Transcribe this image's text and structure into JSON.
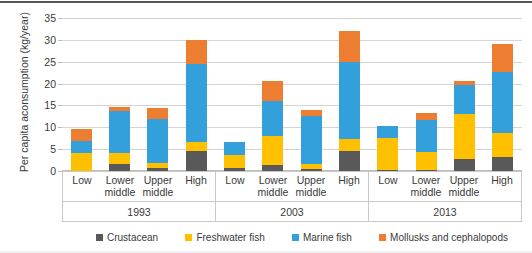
{
  "chart_data": {
    "type": "bar",
    "subtype": "stacked-bar-grouped",
    "title": "",
    "xlabel": "",
    "ylabel": "Per capita aconsumption (kg/year)",
    "ylim": [
      0,
      35
    ],
    "yticks": [
      0,
      5,
      10,
      15,
      20,
      25,
      30,
      35
    ],
    "grid": true,
    "legend_position": "bottom",
    "group_labels": [
      "1993",
      "2003",
      "2013"
    ],
    "categories": [
      "Low",
      "Lower middle",
      "Upper middle",
      "High"
    ],
    "series": [
      {
        "name": "Crustacean",
        "color": "#595959",
        "values_by_group": {
          "1993": [
            0.0,
            1.7,
            0.7,
            4.5
          ],
          "2003": [
            0.6,
            1.3,
            0.5,
            4.5
          ],
          "2013": [
            0.3,
            0.2,
            2.8,
            3.3
          ]
        }
      },
      {
        "name": "Freshwater fish",
        "color": "#ffc000",
        "values_by_group": {
          "1993": [
            4.1,
            2.5,
            1.2,
            2.1
          ],
          "2003": [
            3.0,
            6.7,
            1.2,
            2.9
          ],
          "2013": [
            7.2,
            4.2,
            10.2,
            5.3
          ]
        }
      },
      {
        "name": "Marine fish",
        "color": "#33a0dc",
        "values_by_group": {
          "1993": [
            2.8,
            9.6,
            10.1,
            17.9
          ],
          "2003": [
            3.1,
            8.0,
            11.0,
            17.6
          ],
          "2013": [
            2.8,
            7.2,
            6.7,
            14.0
          ]
        }
      },
      {
        "name": "Mollusks and cephalopods",
        "color": "#ed7d31",
        "values_by_group": {
          "1993": [
            2.8,
            0.9,
            2.5,
            5.5
          ],
          "2003": [
            0.0,
            4.5,
            1.3,
            7.0
          ],
          "2013": [
            0.0,
            1.6,
            1.0,
            6.4
          ]
        }
      }
    ],
    "totals_by_group": {
      "1993": [
        9.7,
        14.7,
        14.5,
        30.0
      ],
      "2003": [
        6.7,
        20.5,
        14.0,
        32.0
      ],
      "2013": [
        10.3,
        13.2,
        20.7,
        29.0
      ]
    }
  },
  "axis": {
    "y_title": "Per capita aconsumption (kg/year)",
    "y_tick_labels": [
      "35",
      "30",
      "25",
      "20",
      "15",
      "10",
      "5",
      "0"
    ]
  },
  "categories": [
    {
      "line1": "Low",
      "line2": ""
    },
    {
      "line1": "Lower",
      "line2": "middle"
    },
    {
      "line1": "Upper",
      "line2": "middle"
    },
    {
      "line1": "High",
      "line2": ""
    }
  ],
  "years": [
    "1993",
    "2003",
    "2013"
  ],
  "legend": [
    {
      "label": "Crustacean",
      "color": "#595959"
    },
    {
      "label": "Freshwater fish",
      "color": "#ffc000"
    },
    {
      "label": "Marine fish",
      "color": "#33a0dc"
    },
    {
      "label": "Mollusks and cephalopods",
      "color": "#ed7d31"
    }
  ]
}
